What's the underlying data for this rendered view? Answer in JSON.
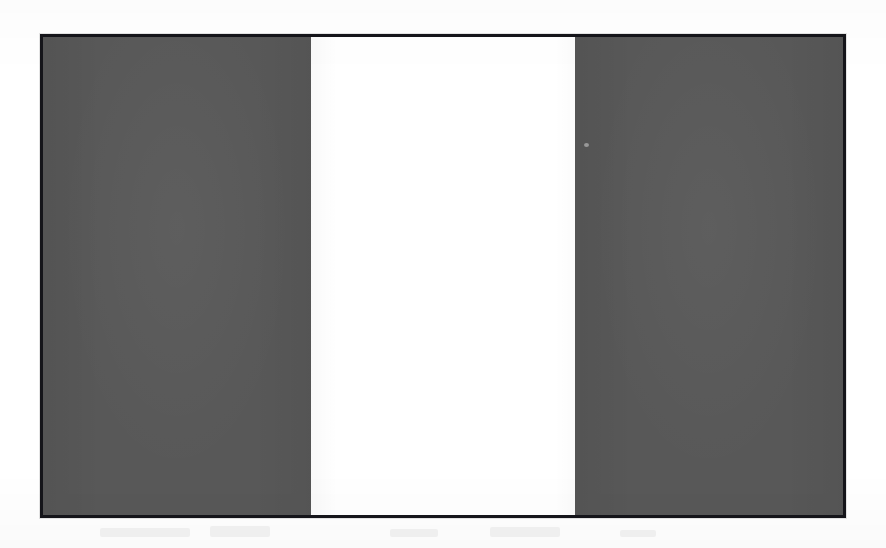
{
  "document": {
    "background_color": "#ffffff",
    "artifact_type": "scanned-print",
    "ghost_bleed_visible": true
  },
  "flag": {
    "name": "vertical-triband-flag",
    "description": "Vertical triband flag rendered in grayscale: dark gray hoist band, white center band, dark gray fly band",
    "orientation": "vertical-triband",
    "aspect_ratio": "5:3",
    "border_color": "#15151a",
    "border_width_px": 3,
    "bands": [
      {
        "position": "hoist",
        "label": "Dark gray band (hoist)",
        "color": "#585858",
        "width_ratio": 0.335,
        "tone": "dark"
      },
      {
        "position": "center",
        "label": "White band (center)",
        "color": "#ffffff",
        "width_ratio": 0.33,
        "tone": "light"
      },
      {
        "position": "fly",
        "label": "Dark gray band (fly)",
        "color": "#585858",
        "width_ratio": 0.335,
        "tone": "dark"
      }
    ]
  },
  "artifacts": {
    "scan_speck_label": "dust-speck",
    "ghost_marks_label": "bleed-through-ghost-text"
  }
}
